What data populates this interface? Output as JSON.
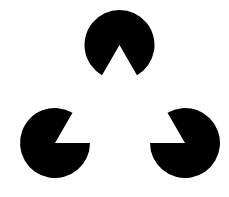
{
  "figure": {
    "title": "",
    "background": "#ffffff",
    "fill": "#000000",
    "shapes": [
      {
        "name": "top",
        "cx": 119.5,
        "cy": 45,
        "r": 35,
        "wedge_deg": [
          60,
          120
        ]
      },
      {
        "name": "bottom-left",
        "cx": 55,
        "cy": 143,
        "r": 35,
        "wedge_deg": [
          300,
          360
        ]
      },
      {
        "name": "bottom-right",
        "cx": 185,
        "cy": 143,
        "r": 35,
        "wedge_deg": [
          180,
          240
        ]
      }
    ],
    "implied_shape": "triangle"
  }
}
